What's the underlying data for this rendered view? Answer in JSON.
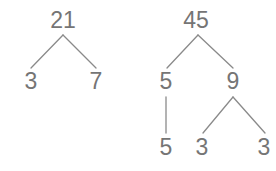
{
  "figure": {
    "kind": "factor-trees",
    "background_color": "#ffffff",
    "stroke_color": "#8a8a8a",
    "text_color": "#757575",
    "stroke_width": 1.3,
    "font_size_px": 23
  },
  "trees": [
    {
      "name": "factor-tree-21",
      "root_label": "21",
      "nodes": [
        {
          "id": "t1-root",
          "label": "21",
          "x": 63,
          "y": 20
        },
        {
          "id": "t1-left",
          "label": "3",
          "x": 31,
          "y": 81
        },
        {
          "id": "t1-right",
          "label": "7",
          "x": 96,
          "y": 81
        }
      ],
      "edges": [
        {
          "id": "t1-e1",
          "x1": 63,
          "y1": 35,
          "x2": 31,
          "y2": 68
        },
        {
          "id": "t1-e2",
          "x1": 63,
          "y1": 35,
          "x2": 96,
          "y2": 68
        }
      ]
    },
    {
      "name": "factor-tree-45",
      "root_label": "45",
      "nodes": [
        {
          "id": "t2-root",
          "label": "45",
          "x": 196,
          "y": 20
        },
        {
          "id": "t2-left",
          "label": "5",
          "x": 166,
          "y": 81
        },
        {
          "id": "t2-right",
          "label": "9",
          "x": 233,
          "y": 81
        },
        {
          "id": "t2-leaf-5",
          "label": "5",
          "x": 166,
          "y": 147
        },
        {
          "id": "t2-leaf-3a",
          "label": "3",
          "x": 202,
          "y": 147
        },
        {
          "id": "t2-leaf-3b",
          "label": "3",
          "x": 264,
          "y": 147
        }
      ],
      "edges": [
        {
          "id": "t2-e1",
          "x1": 198,
          "y1": 35,
          "x2": 167,
          "y2": 68
        },
        {
          "id": "t2-e2",
          "x1": 198,
          "y1": 35,
          "x2": 233,
          "y2": 68
        },
        {
          "id": "t2-e3",
          "x1": 166,
          "y1": 97,
          "x2": 166,
          "y2": 133
        },
        {
          "id": "t2-e4",
          "x1": 233,
          "y1": 97,
          "x2": 203,
          "y2": 133
        },
        {
          "id": "t2-e5",
          "x1": 233,
          "y1": 97,
          "x2": 265,
          "y2": 133
        }
      ]
    }
  ]
}
